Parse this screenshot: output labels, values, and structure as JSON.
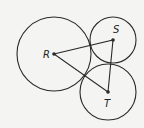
{
  "diagram": {
    "stroke_color": "#2a2a2a",
    "background": "#f4f4f2",
    "circles": [
      {
        "label": "R",
        "cx": 54,
        "cy": 54,
        "r": 37
      },
      {
        "label": "S",
        "cx": 113,
        "cy": 40,
        "r": 23
      },
      {
        "label": "T",
        "cx": 108,
        "cy": 92,
        "r": 28
      }
    ],
    "labels": {
      "R": "R",
      "S": "S",
      "T": "T"
    },
    "triangle": [
      "R",
      "S",
      "T"
    ]
  }
}
